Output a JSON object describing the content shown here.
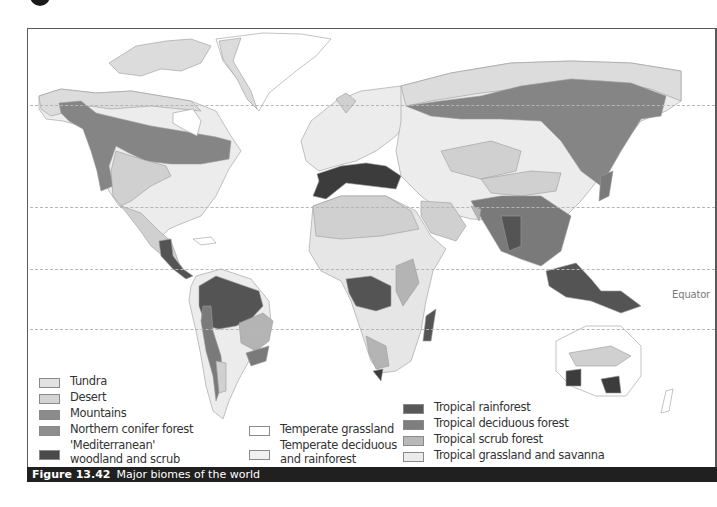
{
  "figure": {
    "number": "Figure 13.42",
    "title": "Major biomes of the world"
  },
  "map": {
    "equator_label": "Equator",
    "latitude_lines": [
      "Arctic Circle",
      "Tropic of Cancer",
      "Equator",
      "Tropic of Capricorn"
    ]
  },
  "legend": {
    "column1": [
      {
        "label": "Tundra",
        "color": "#e2e2e2"
      },
      {
        "label": "Desert",
        "color": "#d4d4d4"
      },
      {
        "label": "Mountains",
        "color": "#8c8c8c"
      },
      {
        "label": "Northern conifer forest",
        "color": "#8e8e8e"
      },
      {
        "label": "'Mediterranean'\nwoodland and scrub",
        "color": "#4a4a4a"
      }
    ],
    "column2": [
      {
        "label": "Temperate grassland",
        "color": "#ffffff"
      },
      {
        "label": "Temperate deciduous\nand rainforest",
        "color": "#f0f0f0"
      }
    ],
    "column3": [
      {
        "label": "Tropical rainforest",
        "color": "#585858"
      },
      {
        "label": "Tropical deciduous forest",
        "color": "#7e7e7e"
      },
      {
        "label": "Tropical scrub forest",
        "color": "#b8b8b8"
      },
      {
        "label": "Tropical grassland and savanna",
        "color": "#ebebeb"
      }
    ]
  },
  "colors": {
    "tundra": "#dcdcdc",
    "desert": "#d0d0d0",
    "conifer": "#858585",
    "mediterranean": "#3c3c3c",
    "temperate_grassland": "#ffffff",
    "temperate_deciduous": "#ececec",
    "tropical_rainforest": "#545454",
    "tropical_deciduous": "#7a7a7a",
    "tropical_scrub": "#b4b4b4",
    "savanna": "#e6e6e6",
    "caption_bg": "#202020"
  }
}
